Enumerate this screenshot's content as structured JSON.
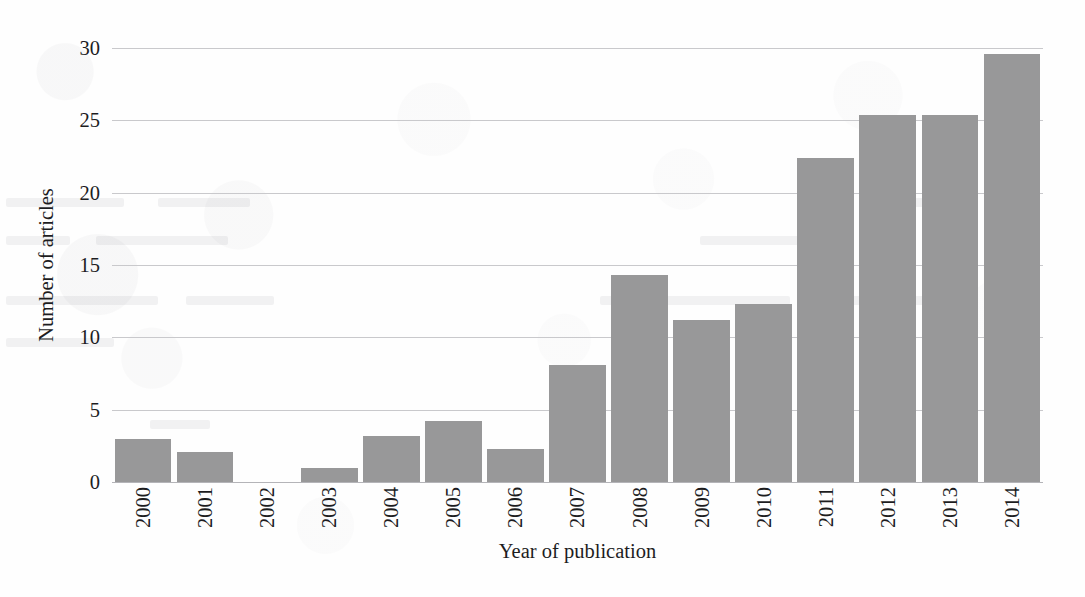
{
  "chart_data": {
    "type": "bar",
    "title": "",
    "xlabel": "Year of publication",
    "ylabel": "Number of articles",
    "categories": [
      "2000",
      "2001",
      "2002",
      "2003",
      "2004",
      "2005",
      "2006",
      "2007",
      "2008",
      "2009",
      "2010",
      "2011",
      "2012",
      "2013",
      "2014"
    ],
    "values": [
      3.0,
      2.1,
      0,
      1.0,
      3.2,
      4.2,
      2.3,
      8.1,
      14.3,
      11.2,
      12.3,
      22.4,
      25.4,
      25.4,
      29.6
    ],
    "ylim": [
      0,
      30
    ],
    "yticks": [
      0,
      5,
      10,
      15,
      20,
      25,
      30
    ],
    "ytick_labels": [
      "0",
      "5",
      "10",
      "15",
      "20",
      "25",
      "30"
    ],
    "grid": true,
    "legend": false,
    "legend_position": "none",
    "bar_color": "#989899",
    "gridline_color": "#c9c9cc",
    "text_color": "#1d1d1f",
    "background_color": "#fefefe",
    "xtick_rotation": -90
  }
}
